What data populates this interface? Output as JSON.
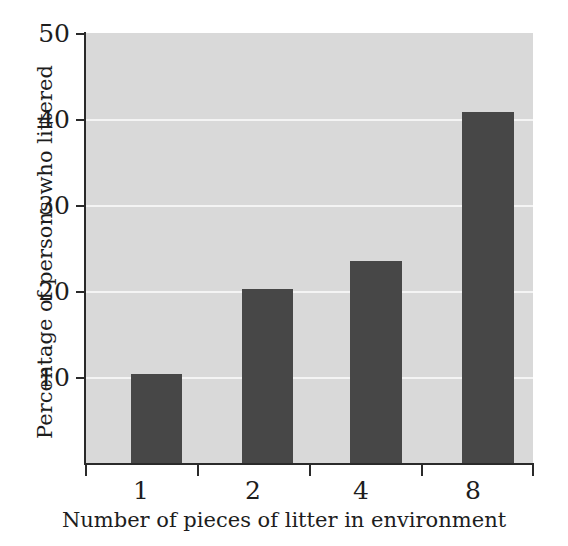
{
  "chart_data": {
    "type": "bar",
    "title": "",
    "subtitle": "",
    "xlabel": "Number of pieces of litter in environment",
    "ylabel": "Percentage of persons who littered",
    "categories": [
      "1",
      "2",
      "4",
      "8"
    ],
    "values": [
      10.4,
      20.2,
      23.5,
      40.8
    ],
    "series": [
      {
        "name": "Percentage of persons who littered",
        "values": [
          10.4,
          20.2,
          23.5,
          40.8
        ]
      }
    ],
    "ylim": [
      0,
      50
    ],
    "yticks": [
      10,
      20,
      30,
      40,
      50
    ],
    "ytick_labels": [
      "10",
      "20",
      "30",
      "40",
      "50"
    ],
    "xtick_labels": [
      "1",
      "2",
      "4",
      "8"
    ],
    "grid": true,
    "grid_axis": "y",
    "legend": false,
    "legend_position": "none",
    "annotations": [],
    "colors": {
      "bar": "#474747",
      "plot_background": "#d9d9d9",
      "gridline": "#f4f4f4",
      "axis": "#2a2a2a",
      "text": "#1d1d1d",
      "figure_background": "#ffffff"
    }
  }
}
